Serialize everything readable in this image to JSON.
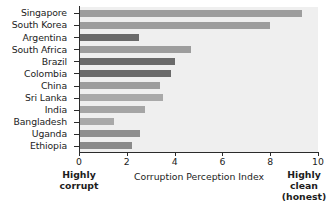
{
  "chart_data": {
    "type": "bar",
    "orientation": "horizontal",
    "title": "",
    "xlabel": "Corruption Perception Index",
    "ylabel": "",
    "xlim": [
      0,
      10
    ],
    "xticks": [
      0,
      2,
      4,
      6,
      8,
      10
    ],
    "xtick_labels": [
      "0",
      "2",
      "4",
      "6",
      "8",
      "10"
    ],
    "grid": false,
    "legend": "none",
    "categories": [
      "Singapore",
      "South Korea",
      "Argentina",
      "South Africa",
      "Brazil",
      "Colombia",
      "China",
      "Sri Lanka",
      "India",
      "Bangladesh",
      "Uganda",
      "Ethiopia"
    ],
    "values": [
      9.35,
      8.0,
      2.5,
      4.7,
      4.0,
      3.85,
      3.4,
      3.5,
      2.75,
      1.45,
      2.55,
      2.2
    ],
    "bar_colors": [
      "#9d9d9d",
      "#9d9d9d",
      "#6a6a6a",
      "#9d9d9d",
      "#6a6a6a",
      "#6a6a6a",
      "#9d9d9d",
      "#a9a9a9",
      "#a5a5a5",
      "#a9a9a9",
      "#8e8e8e",
      "#8a8a8a"
    ],
    "annotations": [
      {
        "position": "bottom-left",
        "text": "Highly corrupt",
        "lines": [
          "Highly",
          "corrupt"
        ]
      },
      {
        "position": "bottom-right",
        "text": "Highly clean (honest)",
        "lines": [
          "Highly",
          "clean",
          "(honest)"
        ]
      }
    ],
    "plot_background": "#efefef",
    "axis_color": "#2b2b2b"
  },
  "annotations": {
    "left": {
      "line1": "Highly",
      "line2": "corrupt"
    },
    "right": {
      "line1": "Highly",
      "line2": "clean",
      "line3": "(honest)"
    }
  }
}
